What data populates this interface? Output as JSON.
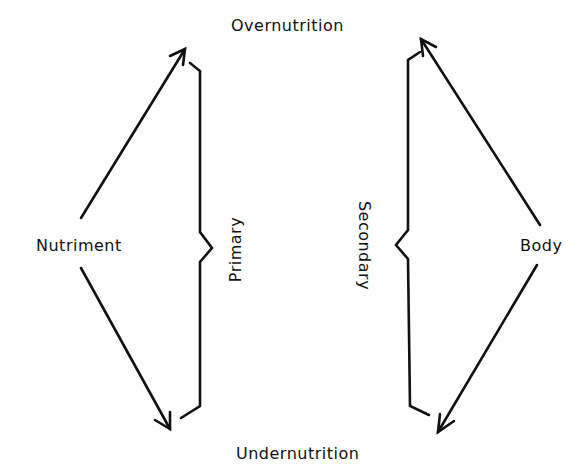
{
  "diagram": {
    "nodes": {
      "top": "Overnutrition",
      "bottom": "Undernutrition",
      "left": "Nutriment",
      "right": "Body"
    },
    "braces": {
      "left": "Primary",
      "right": "Secondary"
    },
    "edges": [
      {
        "from": "Nutriment",
        "to": "Overnutrition"
      },
      {
        "from": "Nutriment",
        "to": "Undernutrition"
      },
      {
        "from": "Body",
        "to": "Overnutrition"
      },
      {
        "from": "Body",
        "to": "Undernutrition"
      }
    ],
    "stroke_color": "#111111"
  }
}
